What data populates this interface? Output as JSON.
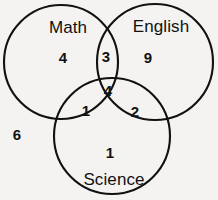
{
  "diagram": {
    "type": "venn",
    "sets": 3,
    "background_color": "#f4f3f1",
    "stroke_color": "#111111",
    "text_color": "#111111",
    "circles": [
      {
        "name": "Math",
        "cx": 61,
        "cy": 62,
        "r": 57
      },
      {
        "name": "English",
        "cx": 155,
        "cy": 62,
        "r": 58
      },
      {
        "name": "Science",
        "cx": 112,
        "cy": 136,
        "r": 58
      }
    ],
    "labels": [
      {
        "name": "math-label",
        "text": "Math",
        "x": 68,
        "y": 27
      },
      {
        "name": "english-label",
        "text": "English",
        "x": 161,
        "y": 26
      },
      {
        "name": "science-label",
        "text": "Science",
        "x": 114,
        "y": 179
      }
    ],
    "regions": [
      {
        "name": "math-only",
        "text": "4",
        "x": 63,
        "y": 57
      },
      {
        "name": "english-only",
        "text": "9",
        "x": 148,
        "y": 57
      },
      {
        "name": "math-english-only",
        "text": "3",
        "x": 106,
        "y": 56
      },
      {
        "name": "all-three",
        "text": "4",
        "x": 108,
        "y": 90
      },
      {
        "name": "math-science-only",
        "text": "1",
        "x": 86,
        "y": 110
      },
      {
        "name": "english-science-only",
        "text": "2",
        "x": 135,
        "y": 111
      },
      {
        "name": "science-only",
        "text": "1",
        "x": 110,
        "y": 152
      },
      {
        "name": "outside-all",
        "text": "6",
        "x": 17,
        "y": 134
      }
    ]
  }
}
